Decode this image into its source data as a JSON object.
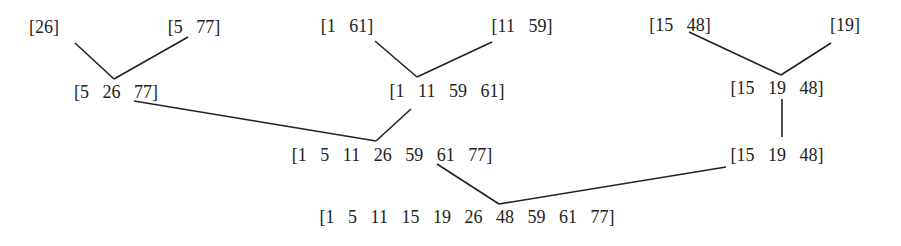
{
  "diagram": {
    "title": "",
    "type": "merge-sort-tree",
    "nodes": {
      "n26": {
        "label": "[26]",
        "x": 44,
        "y": 27
      },
      "n5_77": {
        "label": "[5   77]",
        "x": 194,
        "y": 27
      },
      "n1_61": {
        "label": "[1   61]",
        "x": 347,
        "y": 26
      },
      "n11_59": {
        "label": "[11   59]",
        "x": 522,
        "y": 26
      },
      "n15_48": {
        "label": "[15   48]",
        "x": 680,
        "y": 25
      },
      "n19": {
        "label": "[19]",
        "x": 845,
        "y": 25
      },
      "n5_26_77": {
        "label": "[5   26   77]",
        "x": 116,
        "y": 92
      },
      "n1_11_59_61": {
        "label": "[1   11   59   61]",
        "x": 447,
        "y": 91
      },
      "n15_19_48_a": {
        "label": "[15   19   48]",
        "x": 777,
        "y": 88
      },
      "n7": {
        "label": "[1   5   11   26   59   61   77]",
        "x": 392,
        "y": 155
      },
      "n15_19_48_b": {
        "label": "[15   19   48]",
        "x": 777,
        "y": 155
      },
      "final": {
        "label": "[1   5   11   15   19   26   48   59   61   77]",
        "x": 467,
        "y": 217
      }
    },
    "edges": [
      {
        "from": "n26",
        "to": "n5_26_77",
        "x1": 75,
        "y1": 43,
        "x2": 114,
        "y2": 79
      },
      {
        "from": "n5_77",
        "to": "n5_26_77",
        "x1": 188,
        "y1": 37,
        "x2": 114,
        "y2": 79
      },
      {
        "from": "n1_61",
        "to": "n1_11_59_61",
        "x1": 375,
        "y1": 41,
        "x2": 417,
        "y2": 77
      },
      {
        "from": "n11_59",
        "to": "n1_11_59_61",
        "x1": 492,
        "y1": 42,
        "x2": 417,
        "y2": 77
      },
      {
        "from": "n15_48",
        "to": "n15_19_48_a",
        "x1": 689,
        "y1": 32,
        "x2": 781,
        "y2": 75
      },
      {
        "from": "n19",
        "to": "n15_19_48_a",
        "x1": 831,
        "y1": 43,
        "x2": 781,
        "y2": 75
      },
      {
        "from": "n15_19_48_a",
        "to": "n15_19_48_b",
        "x1": 782,
        "y1": 99,
        "x2": 782,
        "y2": 137
      },
      {
        "from": "n5_26_77",
        "to": "n7",
        "x1": 134,
        "y1": 101,
        "x2": 376,
        "y2": 141
      },
      {
        "from": "n1_11_59_61",
        "to": "n7",
        "x1": 411,
        "y1": 109,
        "x2": 376,
        "y2": 141
      },
      {
        "from": "n7",
        "to": "final",
        "x1": 437,
        "y1": 164,
        "x2": 499,
        "y2": 204
      },
      {
        "from": "n15_19_48_b",
        "to": "final",
        "x1": 726,
        "y1": 167,
        "x2": 499,
        "y2": 204
      }
    ],
    "colors": {
      "text": "#222222",
      "lines": "#222222",
      "background": "#ffffff"
    }
  }
}
